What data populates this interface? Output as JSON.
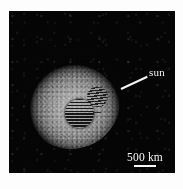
{
  "figure": {
    "type": "astronomical-image",
    "background_color": "#ffffff",
    "panel": {
      "background_color": "#050505",
      "caption_alt": "Grayscale telescope image of a comet nucleus surrounded by a diffuse dust coma"
    }
  },
  "annotations": {
    "sun_direction": {
      "label": "sun",
      "color": "#f4f4f4",
      "arrow_name": "sun-direction-arrow"
    },
    "scale": {
      "label": "500 km",
      "value": 500,
      "unit": "km",
      "color": "#f6f6f6",
      "bar_name": "scale-bar"
    }
  },
  "features": {
    "coma": {
      "name": "dust-coma",
      "color_bright": "#b9b9b9",
      "color_edge": "#4e4e4e"
    },
    "nucleus": {
      "name": "nucleus-region",
      "shape": "circle",
      "fill": "horizontal-hatch",
      "color": "#0a0a0a"
    },
    "secondary_patch": {
      "name": "secondary-hatched-region",
      "shape": "irregular",
      "fill": "horizontal-hatch",
      "color": "#101010"
    }
  }
}
